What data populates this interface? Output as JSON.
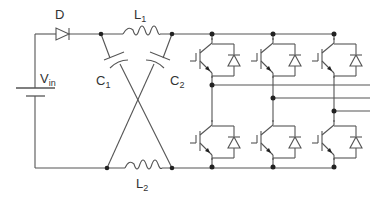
{
  "diagram": {
    "labels": {
      "diode": "D",
      "source": {
        "main": "V",
        "sub": "in"
      },
      "inductor1": {
        "main": "L",
        "sub": "1"
      },
      "inductor2": {
        "main": "L",
        "sub": "2"
      },
      "capacitor1": {
        "main": "C",
        "sub": "1"
      },
      "capacitor2": {
        "main": "C",
        "sub": "2"
      }
    },
    "components": [
      {
        "id": "Vin",
        "type": "dc-source"
      },
      {
        "id": "D",
        "type": "diode"
      },
      {
        "id": "L1",
        "type": "inductor"
      },
      {
        "id": "L2",
        "type": "inductor"
      },
      {
        "id": "C1",
        "type": "capacitor"
      },
      {
        "id": "C2",
        "type": "capacitor"
      },
      {
        "id": "bridge",
        "type": "three-phase-igbt-bridge",
        "legs": 3,
        "switches": 6
      }
    ],
    "colors": {
      "wire": "#555555",
      "node": "#222222"
    }
  }
}
